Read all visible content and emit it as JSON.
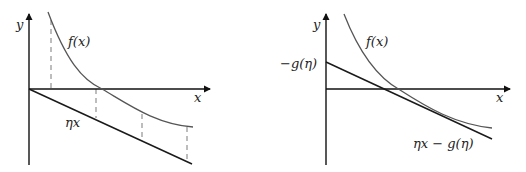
{
  "left_panel": {
    "y_axis_label": "y",
    "x_axis_label": "x",
    "curve_label": "f(x)",
    "line_label": "ηx"
  },
  "right_panel": {
    "y_axis_label": "y",
    "x_axis_label": "x",
    "curve_label": "f(x)",
    "intercept_label": "−g(η)",
    "line_label": "ηx − g(η)"
  },
  "colors": {
    "axis": "#111111",
    "curve": "#555555",
    "line": "#1a1a1a",
    "dashed": "#9a9a9a"
  }
}
